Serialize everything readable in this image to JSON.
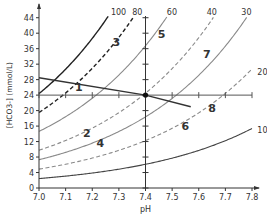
{
  "chart_data": {
    "type": "line",
    "title": "",
    "xlabel": "pH",
    "ylabel": "[HCO3-] (mmol/L)",
    "xlim": [
      7.0,
      7.8
    ],
    "ylim": [
      0,
      46
    ],
    "x_ticks": [
      "7.0",
      "7.1",
      "7.2",
      "7.3",
      "7.4",
      "7.5",
      "7.6",
      "7.7",
      "7.8"
    ],
    "y_ticks": [
      "0",
      "4",
      "8",
      "12",
      "16",
      "20",
      "24",
      "28",
      "32",
      "36",
      "40",
      "44"
    ],
    "grid": false,
    "legend": "none",
    "isobars": [
      {
        "name": "100",
        "pco2": 100,
        "style": "solid",
        "color": "#222222",
        "label_pos": [
          7.27,
          45.5
        ]
      },
      {
        "name": "80",
        "pco2": 80,
        "style": "dashed",
        "color": "#222222",
        "label_pos": [
          7.35,
          45.5
        ]
      },
      {
        "name": "60",
        "pco2": 60,
        "style": "solid",
        "color": "#8a8a8a",
        "label_pos": [
          7.48,
          45.5
        ]
      },
      {
        "name": "40",
        "pco2": 40,
        "style": "dashed",
        "color": "#8a8a8a",
        "label_pos": [
          7.63,
          45.5
        ]
      },
      {
        "name": "30",
        "pco2": 30,
        "style": "solid",
        "color": "#8a8a8a",
        "label_pos": [
          7.76,
          45.5
        ]
      },
      {
        "name": "20",
        "pco2": 20,
        "style": "dashed",
        "color": "#8a8a8a",
        "label_pos": [
          7.82,
          30
        ]
      },
      {
        "name": "10",
        "pco2": 10,
        "style": "solid",
        "color": "#444444",
        "label_pos": [
          7.82,
          15
        ]
      }
    ],
    "buffer_line": {
      "points": [
        [
          7.0,
          28.5
        ],
        [
          7.4,
          24.0
        ],
        [
          7.57,
          21.0
        ]
      ],
      "color": "#333333"
    },
    "normal_point": {
      "x": 7.4,
      "y": 24
    },
    "numbered_labels": [
      {
        "text": "1",
        "x": 7.15,
        "y": 26.2
      },
      {
        "text": "2",
        "x": 7.18,
        "y": 14.2
      },
      {
        "text": "3",
        "x": 7.29,
        "y": 37.6
      },
      {
        "text": "4",
        "x": 7.23,
        "y": 11.7
      },
      {
        "text": "5",
        "x": 7.46,
        "y": 39.8
      },
      {
        "text": "6",
        "x": 7.55,
        "y": 16.0
      },
      {
        "text": "7",
        "x": 7.63,
        "y": 34.5
      },
      {
        "text": "8",
        "x": 7.65,
        "y": 20.6
      }
    ]
  }
}
